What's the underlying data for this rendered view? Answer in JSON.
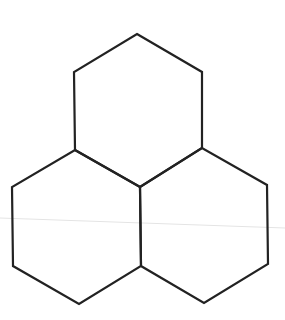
{
  "diagram": {
    "type": "hexagon-cluster",
    "stroke_color": "#222222",
    "stroke_width": 2.2,
    "background": "#ffffff",
    "hexagons": [
      {
        "name": "top",
        "points": [
          [
            137,
            34
          ],
          [
            202,
            72
          ],
          [
            202,
            148
          ],
          [
            140,
            187
          ],
          [
            75,
            150
          ],
          [
            74,
            72
          ]
        ]
      },
      {
        "name": "bottom-left",
        "points": [
          [
            75,
            150
          ],
          [
            140,
            187
          ],
          [
            141,
            266
          ],
          [
            79,
            304
          ],
          [
            13,
            266
          ],
          [
            12,
            187
          ]
        ]
      },
      {
        "name": "bottom-right",
        "points": [
          [
            140,
            187
          ],
          [
            202,
            148
          ],
          [
            267,
            185
          ],
          [
            268,
            264
          ],
          [
            204,
            303
          ],
          [
            141,
            266
          ]
        ]
      }
    ],
    "artifact_line": {
      "x1": 0,
      "y1": 218,
      "x2": 285,
      "y2": 228,
      "color": "#e4e4e4"
    }
  }
}
